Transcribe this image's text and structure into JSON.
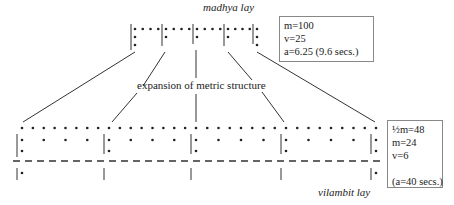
{
  "top_label": "madhya lay",
  "bottom_label": "vilambit lay",
  "middle_label": "expansion of metric structure",
  "top_box": {
    "lines": [
      "m=100",
      "v=25",
      "a=6.25 (9.6 secs.)"
    ]
  },
  "bottom_box": {
    "lines": [
      "½m=48",
      "m=24",
      "v=6",
      "",
      "(a=40 secs.)"
    ]
  }
}
